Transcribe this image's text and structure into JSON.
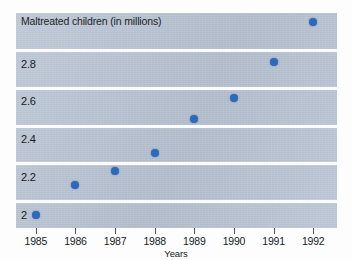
{
  "chart_data": {
    "type": "scatter",
    "title": "Maltreated children (in millions)",
    "xlabel": "Years",
    "ylabel": "",
    "categories": [
      "1985",
      "1986",
      "1987",
      "1988",
      "1989",
      "1990",
      "1991",
      "1992"
    ],
    "x": [
      1985,
      1986,
      1987,
      1988,
      1989,
      1990,
      1991,
      1992
    ],
    "values": [
      1.93,
      2.09,
      2.16,
      2.26,
      2.44,
      2.55,
      2.74,
      2.95
    ],
    "series": [
      {
        "name": "Maltreated children (in millions)",
        "values": [
          1.93,
          2.09,
          2.16,
          2.26,
          2.44,
          2.55,
          2.74,
          2.95
        ]
      }
    ],
    "ytick_labels": [
      "2.8",
      "2.6",
      "2.4",
      "2.2",
      "2"
    ],
    "ytick_values": [
      2.8,
      2.6,
      2.4,
      2.2,
      2.0
    ],
    "ylim": [
      1.86,
      3.0
    ],
    "xlim": [
      1984.5,
      1992.6
    ],
    "grid": "horizontal",
    "legend": "none",
    "marker_color": "#2a6cbb",
    "panel_color": "#b8c3d3",
    "gridline_color": "#fbfcfe"
  },
  "axes": {
    "y_ticks": [
      {
        "label": "2.8",
        "value": 2.8
      },
      {
        "label": "2.6",
        "value": 2.6
      },
      {
        "label": "2.4",
        "value": 2.4
      },
      {
        "label": "2.2",
        "value": 2.2
      },
      {
        "label": "2",
        "value": 2.0
      }
    ],
    "x_ticks": [
      {
        "label": "1985",
        "value": 1985
      },
      {
        "label": "1986",
        "value": 1986
      },
      {
        "label": "1987",
        "value": 1987
      },
      {
        "label": "1988",
        "value": 1988
      },
      {
        "label": "1989",
        "value": 1989
      },
      {
        "label": "1990",
        "value": 1990
      },
      {
        "label": "1991",
        "value": 1991
      },
      {
        "label": "1992",
        "value": 1992
      }
    ]
  }
}
